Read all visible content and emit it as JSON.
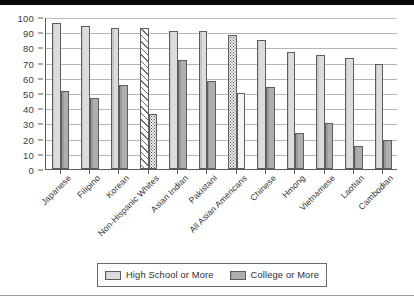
{
  "chart_data": {
    "type": "bar",
    "title": "",
    "xlabel": "",
    "ylabel": "",
    "ylim": [
      0,
      100
    ],
    "y_ticks": [
      0,
      10,
      20,
      30,
      40,
      50,
      60,
      70,
      80,
      90,
      100
    ],
    "grid": true,
    "legend_position": "bottom",
    "categories": [
      "Japanese",
      "Filipino",
      "Korean",
      "Non-Hispanic Whites",
      "Asian Indian",
      "Pakistani",
      "All Asian Americans",
      "Chinese",
      "Hmong",
      "Vietnamese",
      "Laotian",
      "Cambodian"
    ],
    "series": [
      {
        "name": "High School or More",
        "values": [
          96,
          94,
          93,
          93,
          91,
          91,
          88,
          85,
          77,
          75,
          73,
          69
        ]
      },
      {
        "name": "College or More",
        "values": [
          51,
          47,
          55,
          36,
          72,
          58,
          50,
          54,
          24,
          30,
          15,
          19
        ]
      }
    ],
    "bar_styles": {
      "High School or More": [
        "light",
        "light",
        "light",
        "hatch",
        "light",
        "light",
        "dots-dark",
        "light",
        "light",
        "light",
        "light",
        "light"
      ],
      "College or More": [
        "dark",
        "dark",
        "dark",
        "dots-dark",
        "dark",
        "dark",
        "dots-light",
        "dark",
        "dark",
        "dark",
        "dark",
        "dark"
      ]
    }
  },
  "legend": {
    "items": [
      {
        "label": "High School or More",
        "swatch": "light"
      },
      {
        "label": "College or More",
        "swatch": "dark"
      }
    ]
  },
  "colors": {
    "series_high_school": "#dcdcdc",
    "series_college": "#aeaeae",
    "grid": "#b6b6b6",
    "axis": "#5a5a5a",
    "text": "#333333",
    "background": "#ffffff"
  }
}
